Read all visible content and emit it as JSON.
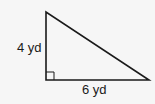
{
  "diagram": {
    "shape": "right-triangle",
    "vertical_leg": {
      "label": "4 yd",
      "value": 4,
      "unit": "yd"
    },
    "horizontal_leg": {
      "label": "6 yd",
      "value": 6,
      "unit": "yd"
    },
    "right_angle_marker": true,
    "colors": {
      "stroke": "#1a1a1a",
      "background": "#f6f6f6"
    }
  }
}
